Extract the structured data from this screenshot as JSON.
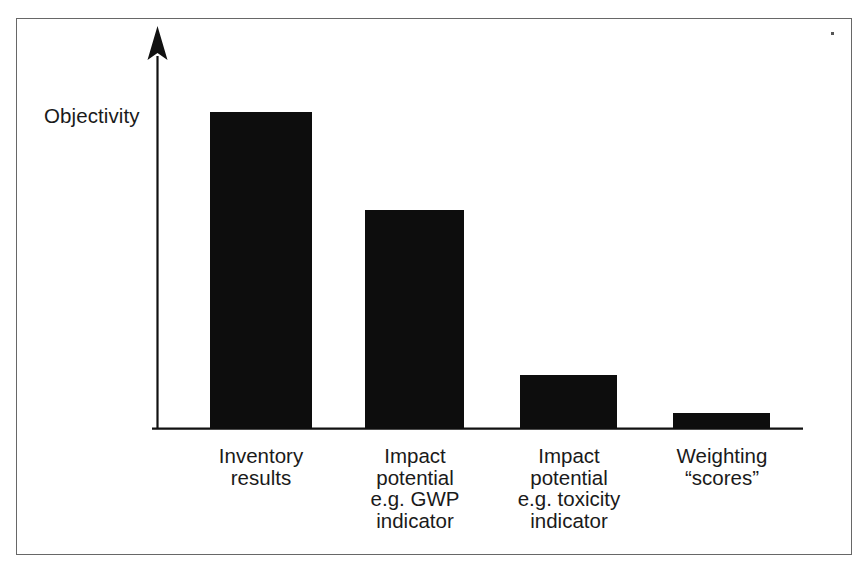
{
  "chart_data": {
    "type": "bar",
    "title": "",
    "subtitle": "",
    "xlabel": "",
    "ylabel": "Objectivity",
    "categories": [
      "Inventory\nresults",
      "Impact\npotential\ne.g. GWP\nindicator",
      "Impact\npotential\ne.g. toxicity\nindicator",
      "Weighting\n“scores”"
    ],
    "category_lines": [
      [
        "Inventory",
        "results"
      ],
      [
        "Impact",
        "potential",
        "e.g. GWP",
        "indicator"
      ],
      [
        "Impact",
        "potential",
        "e.g. toxicity",
        "indicator"
      ],
      [
        "Weighting",
        "“scores”"
      ]
    ],
    "values": [
      100,
      69,
      17,
      5
    ],
    "value_units": "relative objectivity (qualitative, unlabeled axis)",
    "ylim": [
      0,
      117
    ],
    "grid": false,
    "legend": null,
    "legend_position": "none",
    "y_axis_has_arrow": true,
    "y_axis_tick_labels": [],
    "x_axis_tick_labels": [
      "Inventory results",
      "Impact potential e.g. GWP indicator",
      "Impact potential e.g. toxicity indicator",
      "Weighting “scores”"
    ],
    "annotations": [],
    "colors": {
      "bar_fill": "#0d0d0d",
      "axis": "#111111",
      "text": "#1a1a1a",
      "frame_border": "#676767",
      "background": "#ffffff"
    }
  },
  "figure": {
    "axis_label": "Objectivity",
    "bars": [
      {
        "label_joined": "Inventory results",
        "value": 100
      },
      {
        "label_joined": "Impact potential e.g. GWP indicator",
        "value": 69
      },
      {
        "label_joined": "Impact potential e.g. toxicity indicator",
        "value": 17
      },
      {
        "label_joined": "Weighting “scores”",
        "value": 5
      }
    ]
  },
  "labels": {
    "cat0": "Inventory\nresults",
    "cat1": "Impact\npotential\ne.g. GWP\nindicator",
    "cat2": "Impact\npotential\ne.g. toxicity\nindicator",
    "cat3": "Weighting\n“scores”"
  }
}
